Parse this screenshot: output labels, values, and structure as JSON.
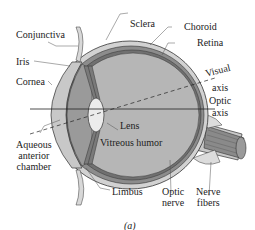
{
  "diagram": {
    "type": "anatomical-cross-section",
    "caption": "(a)",
    "labels": {
      "conjunctiva": "Conjunctiva",
      "iris": "Iris",
      "cornea": "Cornea",
      "aqueous_line1": "Aqueous",
      "aqueous_line2": "anterior",
      "aqueous_line3": "chamber",
      "sclera": "Sclera",
      "choroid": "Choroid",
      "retina": "Retina",
      "visual_axis_line1": "Visual",
      "visual_axis_line2": "axis",
      "optic_axis_line1": "Optic",
      "optic_axis_line2": "axis",
      "lens": "Lens",
      "vitreous_humor": "Vitreous humor",
      "limbus": "Limbus",
      "optic_nerve_line1": "Optic",
      "optic_nerve_line2": "nerve",
      "nerve_fibers_line1": "Nerve",
      "nerve_fibers_line2": "fibers"
    },
    "colors": {
      "sclera": "#c8c8c8",
      "choroid": "#8c8c8c",
      "retina": "#6e6e6e",
      "vitreous": "#b4b4b4",
      "anterior_chamber": "#a0a0a0",
      "lens": "#ececec",
      "outline": "#333333"
    }
  }
}
